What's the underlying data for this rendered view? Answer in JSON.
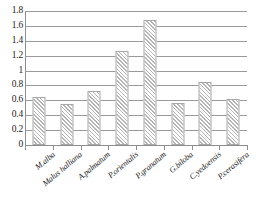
{
  "chart_data": {
    "type": "bar",
    "title": "",
    "subtitle": "",
    "xlabel": "",
    "ylabel": "",
    "categories": [
      "M.alba",
      "Malus halliana",
      "A.palmatum",
      "P.orientalis",
      "P.granatum",
      "G.biloba",
      "C.yedoensis",
      "P.cerasifera"
    ],
    "values": [
      0.65,
      0.55,
      0.73,
      1.26,
      1.68,
      0.57,
      0.85,
      0.62
    ],
    "ylim": [
      0,
      1.8
    ],
    "ytick_labels": [
      "0",
      "0.2",
      "0.4",
      "0.6",
      "0.8",
      "1",
      "1.2",
      "1.4",
      "1.6",
      "1.8"
    ],
    "ytick_values": [
      0,
      0.2,
      0.4,
      0.6,
      0.8,
      1,
      1.2,
      1.4,
      1.6,
      1.8
    ],
    "grid": true,
    "legend": "none",
    "bar_fill": "diagonal-hatch",
    "colors": {
      "grid": "#9a9a9a",
      "axis": "#8d8d8d",
      "bar_edge": "#a8a8a8",
      "bar_hatch": "#b4b4b4",
      "text": "#1c1c1c",
      "background": "#ffffff"
    }
  }
}
